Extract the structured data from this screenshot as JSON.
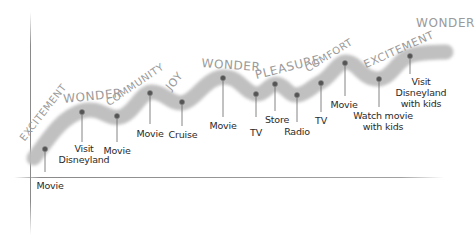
{
  "diagram": {
    "type": "experience-curve",
    "colors": {
      "band": "#bdbdbd",
      "dot": "#555555",
      "stem": "#666666",
      "axis": "#8a8a8a",
      "emotion_text": "#9a9a9a",
      "label_text": "#2a2a2a"
    },
    "points": [
      {
        "label": "Movie",
        "x": 45,
        "y": 149
      },
      {
        "label": "Visit Disneyland",
        "x": 82,
        "y": 112
      },
      {
        "label": "Movie",
        "x": 117,
        "y": 116
      },
      {
        "label": "Movie",
        "x": 150,
        "y": 93
      },
      {
        "label": "Cruise",
        "x": 182,
        "y": 102
      },
      {
        "label": "Movie",
        "x": 223,
        "y": 78
      },
      {
        "label": "TV",
        "x": 256,
        "y": 94
      },
      {
        "label": "Store",
        "x": 275,
        "y": 84
      },
      {
        "label": "Radio",
        "x": 297,
        "y": 95
      },
      {
        "label": "TV",
        "x": 321,
        "y": 83
      },
      {
        "label": "Movie",
        "x": 345,
        "y": 63
      },
      {
        "label": "Watch movie with kids",
        "x": 379,
        "y": 79
      },
      {
        "label": "Visit Disneyland with kids",
        "x": 410,
        "y": 56
      }
    ],
    "emotions": [
      {
        "text": "EXCITEMENT"
      },
      {
        "text": "WONDER"
      },
      {
        "text": "COMMUNITY"
      },
      {
        "text": "JOY"
      },
      {
        "text": "WONDER"
      },
      {
        "text": "PLEASURE"
      },
      {
        "text": "COMFORT"
      },
      {
        "text": "EXCITEMENT"
      },
      {
        "text": "WONDER"
      }
    ],
    "labels": {
      "l0": "Movie",
      "l1a": "Visit",
      "l1b": "Disneyland",
      "l2": "Movie",
      "l3": "Movie",
      "l4": "Cruise",
      "l5": "Movie",
      "l6": "TV",
      "l7": "Store",
      "l8": "Radio",
      "l9": "TV",
      "l10": "Movie",
      "l11a": "Watch movie",
      "l11b": "with kids",
      "l12a": "Visit",
      "l12b": "Disneyland",
      "l12c": "with kids"
    }
  }
}
